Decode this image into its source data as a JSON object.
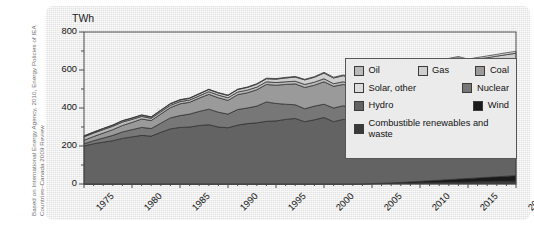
{
  "caption": {
    "line1": "Based on International Energy Agency, 2010, Energy Policies of IEA",
    "line2": "Countries–Canada 2009 Review"
  },
  "axis": {
    "y_unit_label": "TWh",
    "y_ticks": [
      "800",
      "600",
      "400",
      "200",
      "0"
    ],
    "x_ticks": [
      "1975",
      "1980",
      "1985",
      "1990",
      "1995",
      "2000",
      "2005",
      "2010",
      "2015",
      "2020"
    ]
  },
  "legend": {
    "items": [
      {
        "label": "Oil",
        "color": "#b9b9b9"
      },
      {
        "label": "Gas",
        "color": "#cfcfcf"
      },
      {
        "label": "Coal",
        "color": "#9a9a9a"
      },
      {
        "label": "Solar, other",
        "color": "#dcdcdc"
      },
      {
        "label": "Nuclear",
        "color": "#777777"
      },
      {
        "label": "Hydro",
        "color": "#636363"
      },
      {
        "label": "Wind",
        "color": "#1a1a1a"
      },
      {
        "label": "Combustible renewables and waste",
        "color": "#3a3a3a"
      }
    ]
  },
  "chart_data": {
    "type": "area",
    "title": "",
    "xlabel": "",
    "ylabel": "TWh",
    "ylim": [
      0,
      800
    ],
    "xlim": [
      1975,
      2020
    ],
    "grid": false,
    "stacked": true,
    "legend_position": "top-right",
    "x": [
      1975,
      1976,
      1977,
      1978,
      1979,
      1980,
      1981,
      1982,
      1983,
      1984,
      1985,
      1986,
      1987,
      1988,
      1989,
      1990,
      1991,
      1992,
      1993,
      1994,
      1995,
      1996,
      1997,
      1998,
      1999,
      2000,
      2001,
      2002,
      2003,
      2004,
      2005,
      2006,
      2007,
      2008,
      2009,
      2010,
      2011,
      2012,
      2013,
      2014,
      2015,
      2016,
      2017,
      2018,
      2019,
      2020
    ],
    "series": [
      {
        "name": "Combustible renewables and waste",
        "color": "#3a3a3a",
        "values": [
          0,
          0,
          0,
          0,
          0,
          0,
          0,
          0,
          0,
          0,
          0,
          0,
          0,
          0,
          0,
          0,
          0,
          0,
          0,
          0,
          0,
          0,
          0,
          0,
          0,
          0,
          0,
          0,
          0,
          0,
          1,
          2,
          3,
          4,
          5,
          6,
          7,
          8,
          9,
          10,
          11,
          12,
          13,
          14,
          15,
          16
        ]
      },
      {
        "name": "Wind",
        "color": "#1a1a1a",
        "values": [
          0,
          0,
          0,
          0,
          0,
          0,
          0,
          0,
          0,
          0,
          0,
          0,
          0,
          0,
          0,
          0,
          0,
          0,
          0,
          0,
          0,
          0,
          0,
          0,
          0,
          0,
          0,
          0,
          0,
          0,
          1,
          2,
          3,
          4,
          6,
          8,
          10,
          12,
          14,
          16,
          18,
          20,
          22,
          24,
          26,
          28
        ]
      },
      {
        "name": "Hydro",
        "color": "#636363",
        "values": [
          200,
          212,
          220,
          228,
          240,
          248,
          256,
          252,
          272,
          290,
          298,
          300,
          308,
          312,
          300,
          296,
          310,
          318,
          322,
          330,
          332,
          340,
          345,
          328,
          338,
          350,
          328,
          340,
          332,
          340,
          352,
          358,
          366,
          375,
          365,
          350,
          372,
          380,
          385,
          390,
          382,
          388,
          392,
          395,
          398,
          400
        ]
      },
      {
        "name": "Nuclear",
        "color": "#777777",
        "values": [
          12,
          16,
          22,
          28,
          34,
          38,
          42,
          40,
          48,
          58,
          62,
          68,
          74,
          82,
          78,
          72,
          82,
          82,
          88,
          102,
          92,
          80,
          72,
          68,
          72,
          70,
          72,
          72,
          70,
          86,
          90,
          94,
          92,
          94,
          90,
          86,
          88,
          94,
          100,
          104,
          96,
          98,
          100,
          102,
          104,
          106
        ]
      },
      {
        "name": "Coal",
        "color": "#9a9a9a",
        "values": [
          18,
          22,
          26,
          30,
          34,
          38,
          44,
          42,
          48,
          54,
          62,
          62,
          70,
          78,
          76,
          72,
          78,
          80,
          86,
          92,
          96,
          104,
          110,
          112,
          110,
          118,
          114,
          112,
          110,
          108,
          106,
          100,
          106,
          102,
          92,
          88,
          86,
          82,
          78,
          74,
          70,
          66,
          62,
          60,
          58,
          56
        ]
      },
      {
        "name": "Oil",
        "color": "#b9b9b9",
        "values": [
          18,
          18,
          18,
          18,
          18,
          16,
          14,
          12,
          12,
          12,
          12,
          12,
          12,
          14,
          14,
          14,
          14,
          14,
          14,
          14,
          14,
          14,
          14,
          16,
          16,
          16,
          14,
          14,
          14,
          14,
          14,
          12,
          12,
          12,
          10,
          10,
          10,
          10,
          10,
          10,
          10,
          10,
          10,
          10,
          10,
          10
        ]
      },
      {
        "name": "Gas",
        "color": "#cfcfcf",
        "values": [
          4,
          4,
          5,
          5,
          6,
          6,
          6,
          6,
          7,
          8,
          8,
          9,
          10,
          11,
          11,
          12,
          13,
          14,
          15,
          16,
          18,
          20,
          22,
          24,
          26,
          30,
          30,
          32,
          34,
          36,
          38,
          40,
          42,
          44,
          46,
          48,
          52,
          56,
          58,
          60,
          62,
          64,
          66,
          68,
          70,
          72
        ]
      },
      {
        "name": "Solar, other",
        "color": "#dcdcdc",
        "values": [
          2,
          2,
          2,
          2,
          2,
          2,
          2,
          2,
          2,
          2,
          2,
          2,
          2,
          2,
          2,
          2,
          2,
          2,
          3,
          3,
          3,
          3,
          3,
          3,
          3,
          4,
          4,
          4,
          4,
          4,
          4,
          5,
          5,
          5,
          5,
          6,
          6,
          6,
          7,
          7,
          8,
          8,
          9,
          9,
          10,
          10
        ]
      }
    ]
  }
}
